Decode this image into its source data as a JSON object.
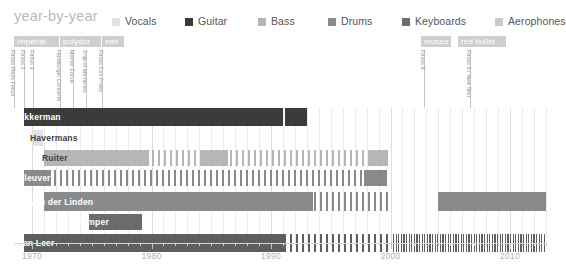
{
  "header": {
    "title": "year-by-year",
    "title_color": "#b9b9b9"
  },
  "legend": {
    "items": [
      {
        "label": "Vocals",
        "color": "#e2e2e2",
        "x": 0
      },
      {
        "label": "Guitar",
        "color": "#3b3b3b",
        "x": 73
      },
      {
        "label": "Bass",
        "color": "#b6b6b6",
        "x": 146
      },
      {
        "label": "Drums",
        "color": "#8a8a8a",
        "x": 216
      },
      {
        "label": "Keyboards",
        "color": "#6b6b6b",
        "x": 290
      },
      {
        "label": "Aerophones",
        "color": "#c9c9c9",
        "x": 383
      }
    ]
  },
  "record_labels": [
    {
      "name": "imperial",
      "x": 14,
      "width": 45
    },
    {
      "name": "polydor",
      "x": 60,
      "width": 41
    },
    {
      "name": "emi",
      "x": 102,
      "width": 22
    },
    {
      "name": "museo",
      "x": 421,
      "width": 30
    },
    {
      "name": "red bullet",
      "x": 458,
      "width": 48
    }
  ],
  "albums": [
    {
      "name": "Focus Plays Focus",
      "x": 14,
      "stem": 58
    },
    {
      "name": "Focus 2",
      "x": 24,
      "stem": 58
    },
    {
      "name": "Focus 3",
      "x": 33,
      "stem": 58
    },
    {
      "name": "Hamburger Concerto",
      "x": 60,
      "stem": 58
    },
    {
      "name": "Mother Focus",
      "x": 73,
      "stem": 58
    },
    {
      "name": "Ship of Memories",
      "x": 86,
      "stem": 58
    },
    {
      "name": "Focus Con Proby",
      "x": 102,
      "stem": 58
    },
    {
      "name": "Focus 8",
      "x": 424,
      "stem": 58
    },
    {
      "name": "Focus 9 / New Skin",
      "x": 470,
      "stem": 58
    }
  ],
  "chart_data": {
    "type": "bar",
    "title": "year-by-year",
    "xlabel": "",
    "ylabel": "",
    "xlim": [
      1969,
      2013
    ],
    "grid": true,
    "legend_position": "top-right",
    "axis": {
      "major_ticks": [
        1970,
        1980,
        1990,
        2000,
        2010
      ],
      "minor_tick_step": 1,
      "tick_labels": [
        "1970",
        "1980",
        "1990",
        "2000",
        "2010"
      ]
    },
    "instrument_colors": {
      "Vocals": "#e2e2e2",
      "Guitar": "#3b3b3b",
      "Bass": "#b6b6b6",
      "Drums": "#8a8a8a",
      "Keyboards": "#6b6b6b",
      "Aerophones": "#c9c9c9"
    },
    "members": [
      {
        "name": "Akkerman",
        "instrument": "Guitar",
        "color": "#3b3b3b",
        "label_on_dark": true,
        "row_top": 0,
        "row_height": 18,
        "name_x": 14,
        "segments": [
          {
            "start": 1969.3,
            "end": 1991.0,
            "style": "solid"
          },
          {
            "start": 1971.0,
            "end": 1990.0,
            "style": "striped"
          },
          {
            "start": 1991.2,
            "end": 1993.0,
            "style": "solid"
          }
        ]
      },
      {
        "name": "Havermans",
        "instrument": "Vocals",
        "color": "#e2e2e2",
        "label_on_dark": false,
        "row_top": 22,
        "row_height": 16,
        "name_x": 26,
        "segments": [
          {
            "start": 1970.0,
            "end": 1970.9,
            "style": "solid"
          }
        ]
      },
      {
        "name": "Ruiter",
        "instrument": "Bass",
        "color": "#b6b6b6",
        "label_on_dark": false,
        "row_top": 42,
        "row_height": 16,
        "name_x": 38,
        "segments": [
          {
            "start": 1971.0,
            "end": 1979.8,
            "style": "solid"
          },
          {
            "start": 1980.0,
            "end": 1999.5,
            "style": "striped"
          },
          {
            "start": 1984.2,
            "end": 1986.4,
            "style": "solid"
          },
          {
            "start": 1998.2,
            "end": 1999.8,
            "style": "solid"
          }
        ]
      },
      {
        "name": "Cleuver",
        "instrument": "Drums",
        "color": "#8a8a8a",
        "label_on_dark": true,
        "row_top": 62,
        "row_height": 16,
        "name_x": 14,
        "segments": [
          {
            "start": 1969.3,
            "end": 1971.6,
            "style": "solid"
          },
          {
            "start": 1971.8,
            "end": 2000.0,
            "style": "striped"
          },
          {
            "start": 1997.8,
            "end": 1999.7,
            "style": "solid"
          }
        ]
      },
      {
        "name": "van der Linden",
        "instrument": "Drums",
        "color": "#8a8a8a",
        "label_on_dark": true,
        "row_top": 84,
        "row_height": 19,
        "name_x": 26,
        "segments": [
          {
            "start": 1971.0,
            "end": 1990.5,
            "style": "solid"
          },
          {
            "start": 1973.0,
            "end": 2000.0,
            "style": "striped"
          },
          {
            "start": 1990.5,
            "end": 1993.5,
            "style": "solid"
          },
          {
            "start": 2004.0,
            "end": 2013.0,
            "style": "solid"
          }
        ]
      },
      {
        "name": "Kemper",
        "instrument": "Keyboards",
        "color": "#6b6b6b",
        "label_on_dark": true,
        "row_top": 106,
        "row_height": 16,
        "name_x": 72,
        "segments": [
          {
            "start": 1974.8,
            "end": 1979.2,
            "style": "solid"
          }
        ]
      },
      {
        "name": "van Leer",
        "instrument": "Keyboards",
        "color": "#5e5e5e",
        "label_on_dark": true,
        "row_top": 126,
        "row_height": 18,
        "name_x": 14,
        "segments": [
          {
            "start": 1969.3,
            "end": 1991.2,
            "style": "solid"
          },
          {
            "start": 1971.0,
            "end": 2000.0,
            "style": "striped"
          },
          {
            "start": 2000.2,
            "end": 2013.0,
            "style": "striped-dense"
          }
        ]
      }
    ]
  }
}
